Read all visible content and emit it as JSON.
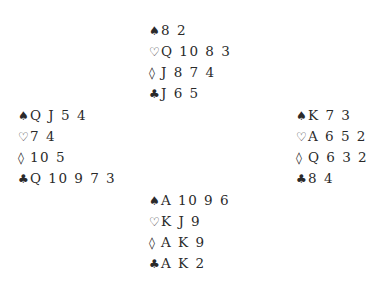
{
  "deal": {
    "north": {
      "spades": "8 2",
      "hearts": "Q 10 8 3",
      "diamonds": "J 8 7 4",
      "clubs": "J 6 5"
    },
    "west": {
      "spades": "Q J 5 4",
      "hearts": "7 4",
      "diamonds": "10 5",
      "clubs": "Q 10 9 7 3"
    },
    "east": {
      "spades": "K 7 3",
      "hearts": "A 6 5 2",
      "diamonds": "Q 6 3 2",
      "clubs": "8 4"
    },
    "south": {
      "spades": "A 10 9 6",
      "hearts": "K J 9",
      "diamonds": "A K 9",
      "clubs": "A K 2"
    }
  },
  "suit_symbols": {
    "spades": "♠",
    "hearts": "♡",
    "diamonds": "◊",
    "clubs": "♣"
  },
  "colors": {
    "text": "#2a2a2a",
    "background": "#ffffff"
  }
}
